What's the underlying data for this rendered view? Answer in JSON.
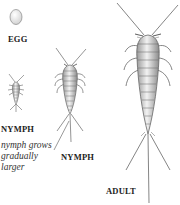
{
  "diagram": {
    "stages": [
      {
        "id": "egg",
        "label": "EGG"
      },
      {
        "id": "nymph-small",
        "label": "NYMPH"
      },
      {
        "id": "nymph-medium",
        "label": "NYMPH"
      },
      {
        "id": "adult",
        "label": "ADULT"
      }
    ],
    "caption": {
      "lines": [
        "nymph grows",
        "gradually",
        "larger"
      ]
    },
    "colors": {
      "body_fill": "#d8d8d8",
      "outline": "#555555",
      "text": "#222222"
    }
  }
}
